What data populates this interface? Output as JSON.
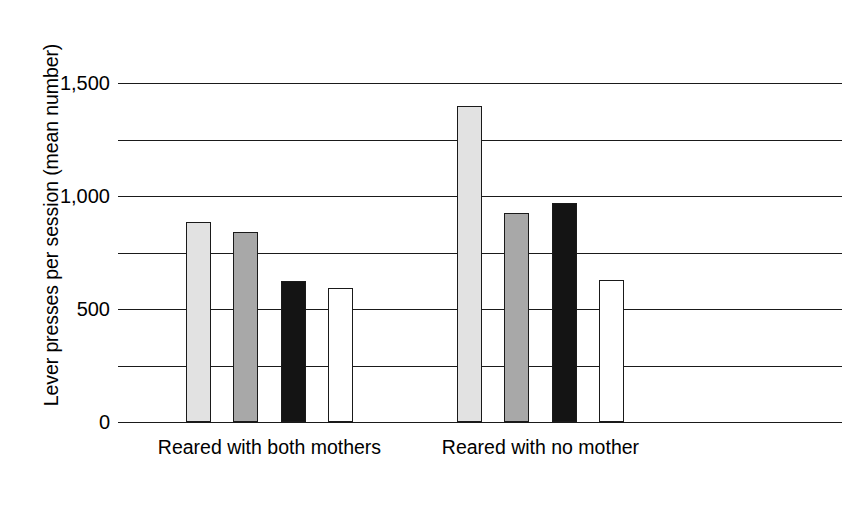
{
  "chart_data": {
    "type": "bar",
    "title": "",
    "subtitle": "",
    "xlabel": "",
    "ylabel": "Lever presses per session (mean number)",
    "ylim": [
      0,
      1500
    ],
    "ytick_labels": [
      "0",
      "500",
      "1,000",
      "1,500"
    ],
    "ytick_values": [
      0,
      500,
      1000,
      1500
    ],
    "gridline_values": [
      0,
      250,
      500,
      750,
      1000,
      1250,
      1500
    ],
    "grid": true,
    "legend": "none",
    "categories": [
      "Reared with both mothers",
      "Reared with no mother"
    ],
    "bar_styles": [
      "light-gray",
      "medium-gray",
      "black",
      "white"
    ],
    "groups": [
      {
        "category": "Reared with both mothers",
        "bars": [
          {
            "style": "light-gray",
            "value": 885
          },
          {
            "style": "medium-gray",
            "value": 840
          },
          {
            "style": "black",
            "value": 625
          },
          {
            "style": "white",
            "value": 595
          }
        ]
      },
      {
        "category": "Reared with no mother",
        "bars": [
          {
            "style": "light-gray",
            "value": 1400
          },
          {
            "style": "medium-gray",
            "value": 925
          },
          {
            "style": "black",
            "value": 970
          },
          {
            "style": "white",
            "value": 630
          }
        ]
      }
    ],
    "colors": {
      "light-gray": "#e2e2e2",
      "medium-gray": "#a8a8a8",
      "black": "#141414",
      "white": "#ffffff",
      "axis": "#1a1a1a"
    }
  }
}
